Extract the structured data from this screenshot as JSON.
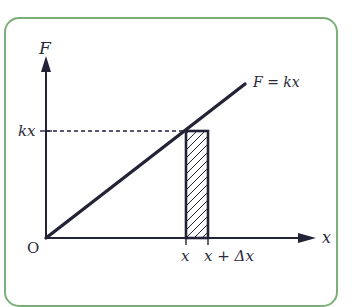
{
  "diagram": {
    "type": "force-displacement graph",
    "axes": {
      "y_label": "F",
      "x_label": "x",
      "origin_label": "O"
    },
    "line": {
      "label": "F = kx",
      "label_parts": [
        "F",
        "=",
        "kx"
      ]
    },
    "level_label": "kx",
    "strip": {
      "left_tick_label": "x",
      "right_tick_label": "x + Δx",
      "right_tick_parts": [
        "x",
        "+",
        "Δx"
      ],
      "hatched": true
    },
    "colors": {
      "frame": "#7cae78",
      "ink": "#232338",
      "background": "#ffffff"
    }
  }
}
